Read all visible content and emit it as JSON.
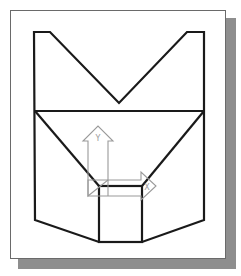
{
  "diagram": {
    "title": "",
    "colors": {
      "outline": "#1a1a1a",
      "ucs_icon": "#9a9a9a",
      "frame_border": "#6a6a6a",
      "shadow": "#8e8e8e",
      "background": "#ffffff"
    },
    "ucs_icon": {
      "y_axis_label": "Y",
      "x_axis_label": "X"
    }
  }
}
